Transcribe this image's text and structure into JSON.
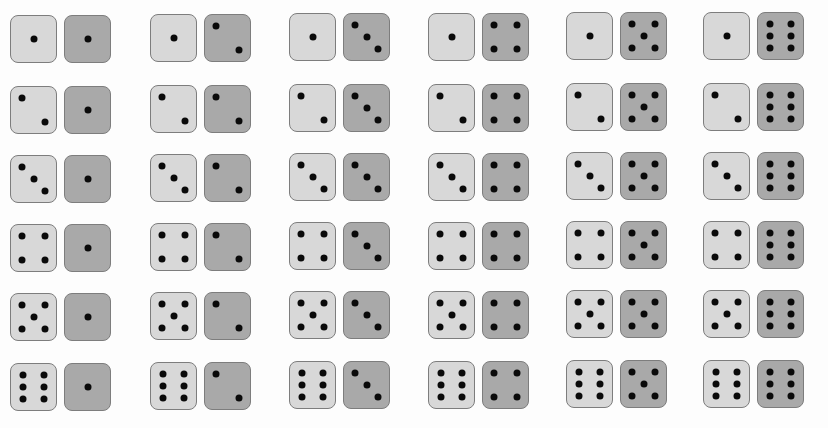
{
  "figure": {
    "colors": {
      "background": "#fdfdfd",
      "light_die_fill": "#d8d8d8",
      "dark_die_fill": "#a9a9a9",
      "die_border": "#7d7d7d",
      "pip": "#0a0a0a"
    },
    "rows": 6,
    "columns": 6,
    "column_x": [
      10,
      150,
      289,
      428,
      566,
      703
    ],
    "row_y": [
      15,
      86,
      155,
      224,
      293,
      363
    ],
    "row_y_offset_per_column": [
      0,
      -1,
      -2,
      -2,
      -3,
      -3
    ],
    "outcomes": [
      [
        {
          "light": 1,
          "dark": 1
        },
        {
          "light": 1,
          "dark": 2
        },
        {
          "light": 1,
          "dark": 3
        },
        {
          "light": 1,
          "dark": 4
        },
        {
          "light": 1,
          "dark": 5
        },
        {
          "light": 1,
          "dark": 6
        }
      ],
      [
        {
          "light": 2,
          "dark": 1
        },
        {
          "light": 2,
          "dark": 2
        },
        {
          "light": 2,
          "dark": 3
        },
        {
          "light": 2,
          "dark": 4
        },
        {
          "light": 2,
          "dark": 5
        },
        {
          "light": 2,
          "dark": 6
        }
      ],
      [
        {
          "light": 3,
          "dark": 1
        },
        {
          "light": 3,
          "dark": 2
        },
        {
          "light": 3,
          "dark": 3
        },
        {
          "light": 3,
          "dark": 4
        },
        {
          "light": 3,
          "dark": 5
        },
        {
          "light": 3,
          "dark": 6
        }
      ],
      [
        {
          "light": 4,
          "dark": 1
        },
        {
          "light": 4,
          "dark": 2
        },
        {
          "light": 4,
          "dark": 3
        },
        {
          "light": 4,
          "dark": 4
        },
        {
          "light": 4,
          "dark": 5
        },
        {
          "light": 4,
          "dark": 6
        }
      ],
      [
        {
          "light": 5,
          "dark": 1
        },
        {
          "light": 5,
          "dark": 2
        },
        {
          "light": 5,
          "dark": 3
        },
        {
          "light": 5,
          "dark": 4
        },
        {
          "light": 5,
          "dark": 5
        },
        {
          "light": 5,
          "dark": 6
        }
      ],
      [
        {
          "light": 6,
          "dark": 1
        },
        {
          "light": 6,
          "dark": 2
        },
        {
          "light": 6,
          "dark": 3
        },
        {
          "light": 6,
          "dark": 4
        },
        {
          "light": 6,
          "dark": 5
        },
        {
          "light": 6,
          "dark": 6
        }
      ]
    ],
    "pip_layouts": {
      "1": [
        [
          50,
          50
        ]
      ],
      "2": [
        [
          24,
          24
        ],
        [
          76,
          76
        ]
      ],
      "3": [
        [
          24,
          24
        ],
        [
          50,
          50
        ],
        [
          76,
          76
        ]
      ],
      "4": [
        [
          24,
          24
        ],
        [
          76,
          24
        ],
        [
          24,
          76
        ],
        [
          76,
          76
        ]
      ],
      "5": [
        [
          24,
          24
        ],
        [
          76,
          24
        ],
        [
          50,
          50
        ],
        [
          24,
          76
        ],
        [
          76,
          76
        ]
      ],
      "6": [
        [
          26,
          24
        ],
        [
          74,
          24
        ],
        [
          26,
          50
        ],
        [
          74,
          50
        ],
        [
          26,
          76
        ],
        [
          74,
          76
        ]
      ]
    }
  }
}
